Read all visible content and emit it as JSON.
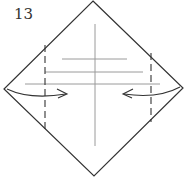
{
  "diagram": {
    "type": "origami-step",
    "step_number": "13",
    "colors": {
      "outline": "#333333",
      "crease": "#9a9a9a",
      "dashed_fold": "#333333",
      "arrow": "#333333",
      "background": "#ffffff"
    },
    "square": {
      "top": [
        93,
        1
      ],
      "right": [
        183,
        88
      ],
      "bottom": [
        94,
        176
      ],
      "left": [
        4,
        89
      ]
    },
    "valley_folds": [
      {
        "x": 45,
        "y1": 45,
        "y2": 130,
        "side": "left"
      },
      {
        "x": 151,
        "y1": 53,
        "y2": 120,
        "side": "right"
      }
    ],
    "crease_lines": [
      {
        "orientation": "vertical",
        "x": 95,
        "y1": 24,
        "y2": 146
      },
      {
        "orientation": "horizontal",
        "y": 59,
        "x1": 62,
        "x2": 127
      },
      {
        "orientation": "horizontal",
        "y": 72,
        "x1": 45,
        "x2": 143
      },
      {
        "orientation": "horizontal",
        "y": 84,
        "x1": 25,
        "x2": 160
      }
    ],
    "arrows": [
      {
        "from": "left-corner",
        "direction": "right",
        "meaning": "fold left corner inward"
      },
      {
        "from": "right-corner",
        "direction": "left",
        "meaning": "fold right corner inward"
      }
    ]
  }
}
